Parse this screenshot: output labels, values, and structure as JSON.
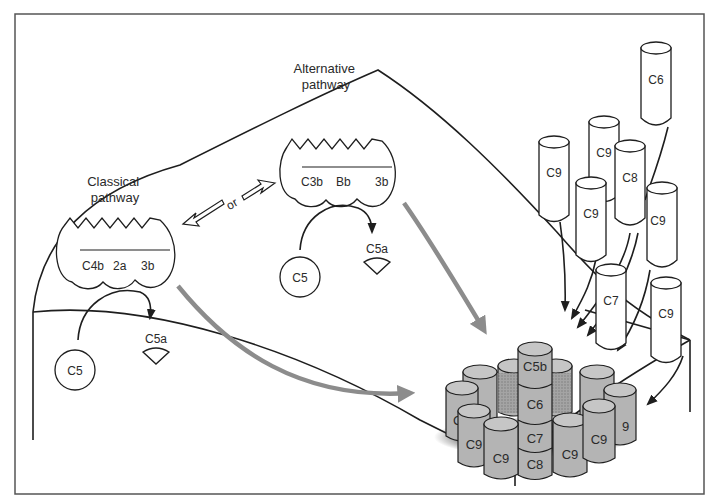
{
  "figure": {
    "labels": {
      "classical_pathway": [
        "Classical",
        "pathway"
      ],
      "alternative_pathway": [
        "Alternative",
        "pathway"
      ],
      "or": "or"
    },
    "classical_convertase": {
      "subunits": [
        "C4b",
        "2a",
        "3b"
      ],
      "substrate": "C5",
      "product": "C5a"
    },
    "alternative_convertase": {
      "subunits": [
        "C3b",
        "Bb",
        "3b"
      ],
      "substrate": "C5",
      "product": "C5a"
    },
    "free_components": [
      {
        "label": "C6"
      },
      {
        "label": "C9"
      },
      {
        "label": "C9"
      },
      {
        "label": "C8"
      },
      {
        "label": "C9"
      },
      {
        "label": "C9"
      },
      {
        "label": "C7"
      },
      {
        "label": "C9"
      }
    ],
    "mac_complex": {
      "center_stack": [
        "C5b",
        "C6",
        "C7",
        "C8"
      ],
      "ring_labels": [
        "C",
        "C9",
        "C9",
        "C9",
        "C9",
        "9"
      ]
    },
    "colors": {
      "line": "#1e1e1e",
      "pathway_arrow": "#8c8c8c",
      "complex_fill": "#b4b4b4",
      "background": "#ffffff"
    }
  }
}
